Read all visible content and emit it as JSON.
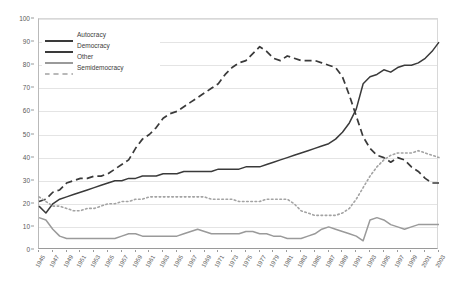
{
  "chart_data": {
    "type": "line",
    "title": "",
    "xlabel": "",
    "ylabel": "",
    "ylim": [
      0,
      100
    ],
    "ytick_step": 10,
    "yticks": [
      0,
      10,
      20,
      30,
      40,
      50,
      60,
      70,
      80,
      90,
      100
    ],
    "grid": true,
    "legend_position": "top-left",
    "x": [
      1945,
      1946,
      1947,
      1948,
      1949,
      1950,
      1951,
      1952,
      1953,
      1954,
      1955,
      1956,
      1957,
      1958,
      1959,
      1960,
      1961,
      1962,
      1963,
      1964,
      1965,
      1966,
      1967,
      1968,
      1969,
      1970,
      1971,
      1972,
      1973,
      1974,
      1975,
      1976,
      1977,
      1978,
      1979,
      1980,
      1981,
      1982,
      1983,
      1984,
      1985,
      1986,
      1987,
      1988,
      1989,
      1990,
      1991,
      1992,
      1993,
      1994,
      1995,
      1996,
      1997,
      1998,
      1999,
      2000,
      2001,
      2002,
      2003
    ],
    "xticks": [
      1945,
      1947,
      1949,
      1951,
      1953,
      1955,
      1957,
      1959,
      1961,
      1963,
      1965,
      1967,
      1969,
      1971,
      1973,
      1975,
      1977,
      1979,
      1981,
      1983,
      1985,
      1987,
      1989,
      1991,
      1993,
      1995,
      1997,
      1999,
      2001,
      2003
    ],
    "series": [
      {
        "name": "Autocracy",
        "color": "#3a3a3a",
        "style": "dashed",
        "values": [
          21,
          22,
          25,
          26,
          29,
          30,
          31,
          31,
          32,
          32,
          33,
          35,
          37,
          39,
          44,
          48,
          50,
          53,
          57,
          59,
          60,
          62,
          64,
          66,
          68,
          70,
          72,
          76,
          79,
          81,
          82,
          85,
          88,
          86,
          83,
          82,
          84,
          83,
          82,
          82,
          82,
          81,
          80,
          79,
          75,
          67,
          58,
          49,
          44,
          41,
          40,
          38,
          40,
          39,
          36,
          34,
          31,
          29,
          29
        ]
      },
      {
        "name": "Democracy",
        "color": "#3a3a3a",
        "style": "solid",
        "values": [
          19,
          16,
          20,
          22,
          23,
          24,
          25,
          26,
          27,
          28,
          29,
          30,
          30,
          31,
          31,
          32,
          32,
          32,
          33,
          33,
          33,
          34,
          34,
          34,
          34,
          34,
          35,
          35,
          35,
          35,
          36,
          36,
          36,
          37,
          38,
          39,
          40,
          41,
          42,
          43,
          44,
          45,
          46,
          48,
          51,
          55,
          61,
          72,
          75,
          76,
          78,
          77,
          79,
          80,
          80,
          81,
          83,
          86,
          90
        ]
      },
      {
        "name": "Other",
        "color": "#9a9a9a",
        "style": "solid",
        "values": [
          14,
          13,
          9,
          6,
          5,
          5,
          5,
          5,
          5,
          5,
          5,
          5,
          6,
          7,
          7,
          6,
          6,
          6,
          6,
          6,
          6,
          7,
          8,
          9,
          8,
          7,
          7,
          7,
          7,
          7,
          8,
          8,
          7,
          7,
          6,
          6,
          5,
          5,
          5,
          6,
          7,
          9,
          10,
          9,
          8,
          7,
          6,
          4,
          13,
          14,
          13,
          11,
          10,
          9,
          10,
          11,
          11,
          11,
          11
        ]
      },
      {
        "name": "Semidemocracy",
        "color": "#a3a3a3",
        "style": "dotted",
        "values": [
          23,
          21,
          19,
          19,
          18,
          17,
          17,
          18,
          18,
          19,
          20,
          20,
          21,
          21,
          22,
          22,
          23,
          23,
          23,
          23,
          23,
          23,
          23,
          23,
          23,
          22,
          22,
          22,
          22,
          21,
          21,
          21,
          21,
          22,
          22,
          22,
          22,
          20,
          17,
          16,
          15,
          15,
          15,
          15,
          16,
          18,
          22,
          27,
          32,
          36,
          39,
          41,
          42,
          42,
          42,
          43,
          42,
          41,
          40
        ]
      }
    ]
  },
  "legend": {
    "items": [
      {
        "label": "Autocracy"
      },
      {
        "label": "Democracy"
      },
      {
        "label": "Other"
      },
      {
        "label": "Semidemocracy"
      }
    ]
  }
}
